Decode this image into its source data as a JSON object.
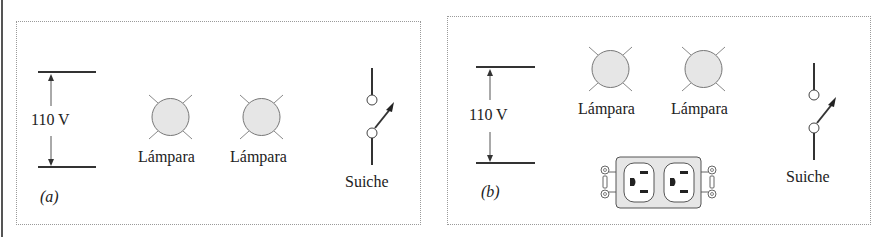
{
  "figure": {
    "panels": [
      {
        "id": "a",
        "caption": "(a)",
        "voltage_label": "110 V",
        "lamps": [
          {
            "label": "Lámpara"
          },
          {
            "label": "Lámpara"
          }
        ],
        "switch_label": "Suiche",
        "has_outlet": false
      },
      {
        "id": "b",
        "caption": "(b)",
        "voltage_label": "110 V",
        "lamps": [
          {
            "label": "Lámpara"
          },
          {
            "label": "Lámpara"
          }
        ],
        "switch_label": "Suiche",
        "has_outlet": true,
        "outlet": "duplex-receptacle"
      }
    ],
    "colors": {
      "lamp_fill": "#e6e6e6",
      "line": "#333333",
      "frame": "#9a9a9a"
    }
  }
}
